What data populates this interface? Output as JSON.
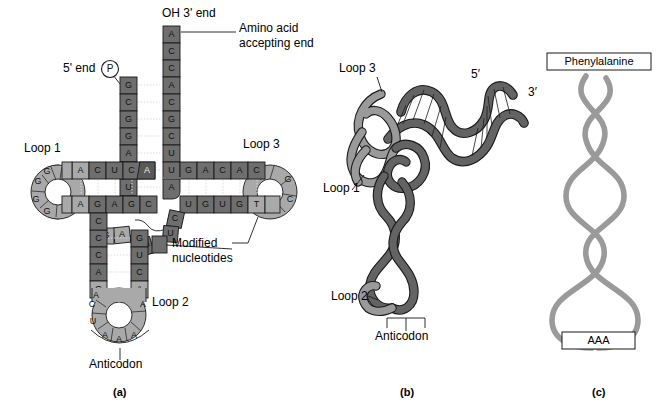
{
  "figure": {
    "panels": [
      "(a)",
      "(b)",
      "(c)"
    ]
  },
  "colors": {
    "loop_light": "#a9a9a9",
    "stem_dark": "#6e6e6e",
    "stem_mid": "#8c8c8c",
    "ribbon_gray": "#9a9a9a",
    "ribbon_dark": "#636363",
    "outline": "#1a1a1a",
    "background": "#ffffff"
  },
  "panel_a": {
    "id": "(a)",
    "labels": {
      "oh_3_end": "OH 3' end",
      "amino_acid_accepting_end_line1": "Amino acid",
      "amino_acid_accepting_end_line2": "accepting end",
      "five_prime_end": "5' end",
      "phosphate_symbol": "P",
      "loop1": "Loop 1",
      "loop2": "Loop 2",
      "loop3": "Loop 3",
      "modified_line1": "Modified",
      "modified_line2": "nucleotides",
      "anticodon": "Anticodon"
    },
    "acceptor_stem": {
      "five_prime_strand": [
        "G",
        "C",
        "G",
        "G",
        "A",
        "U",
        "U",
        "U"
      ],
      "three_prime_strand": [
        "A",
        "C",
        "C",
        "A",
        "C",
        "G",
        "C",
        "U",
        "U",
        "A",
        "A"
      ],
      "note": "3' strand read top to bottom; top 4 (A C C A) are single stranded overhang"
    },
    "loop1_arm": {
      "name": "D arm / Loop 1",
      "top_strand": [
        "A",
        "U",
        "U"
      ],
      "stem_upper": [
        "G",
        "A",
        "C",
        "U",
        "C",
        "",
        "A"
      ],
      "stem_lower": [
        "G",
        "G",
        "G",
        "A",
        "G",
        "A",
        "G",
        "C"
      ],
      "loop_letters": [
        "G",
        "A",
        "G",
        "G",
        "G"
      ]
    },
    "loop3_arm": {
      "name": "T arm / Loop 3",
      "upper_strand": [
        "G",
        "A",
        "C",
        "A",
        "C",
        "C"
      ],
      "lower_strand": [
        "U",
        "G",
        "U",
        "G",
        "T"
      ],
      "loop_letters": [
        "U",
        "G",
        "C"
      ]
    },
    "variable_loop": [
      "C",
      "U",
      "G",
      "A",
      "G"
    ],
    "anticodon_arm": {
      "name": "Anticodon arm / Loop 2",
      "left_strand": [
        "C",
        "C",
        "A",
        "G",
        "A",
        "C",
        "U"
      ],
      "right_strand": [
        "G",
        "G",
        "U",
        "C",
        "A",
        "A"
      ],
      "anticodon_bases": [
        "A",
        "A",
        "A"
      ]
    }
  },
  "panel_b": {
    "id": "(b)",
    "labels": {
      "loop1": "Loop 1",
      "loop2": "Loop 2",
      "loop3": "Loop 3",
      "five_prime": "5′",
      "three_prime": "3′",
      "anticodon": "Anticodon"
    }
  },
  "panel_c": {
    "id": "(c)",
    "labels": {
      "amino_acid": "Phenylalanine",
      "anticodon_codon": "AAA"
    }
  }
}
